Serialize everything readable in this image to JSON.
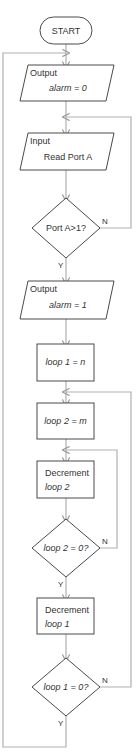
{
  "flowchart": {
    "start": {
      "label": "START"
    },
    "output1": {
      "title": "Output",
      "text": "alarm = 0"
    },
    "input1": {
      "title": "Input",
      "text": "Read Port A"
    },
    "decision1": {
      "text": "Port A>1?",
      "yes": "Y",
      "no": "N"
    },
    "output2": {
      "title": "Output",
      "text": "alarm = 1"
    },
    "process1": {
      "text": "loop 1 = n"
    },
    "process2": {
      "text": "loop 2 = m"
    },
    "process3": {
      "title": "Decrement",
      "text": "loop 2"
    },
    "decision2": {
      "text": "loop 2 = 0?",
      "yes": "Y",
      "no": "N"
    },
    "process4": {
      "title": "Decrement",
      "text": "loop 1"
    },
    "decision3": {
      "text": "loop 1 = 0?",
      "yes": "Y",
      "no": "N"
    }
  },
  "colors": {
    "shape_stroke": "#4a4a4a",
    "connector": "#b0b0b0",
    "text": "#333333"
  }
}
